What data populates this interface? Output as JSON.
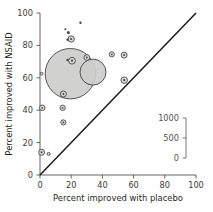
{
  "chart": {
    "type": "scatter",
    "title": "",
    "xlabel": "Percent improved with placebo",
    "ylabel": "Percent improved with NSAID",
    "xlim": [
      0,
      100
    ],
    "ylim": [
      0,
      100
    ],
    "xticks": [
      "0",
      "20",
      "40",
      "60",
      "80",
      "100"
    ],
    "yticks": [
      "0",
      "20",
      "40",
      "60",
      "80",
      "100"
    ],
    "grid": false,
    "reference_line": {
      "name": "line-of-equality",
      "from": [
        0,
        0
      ],
      "to": [
        100,
        100
      ]
    },
    "size_legend": {
      "name": "bubble-size-scale",
      "title": "",
      "ticks": [
        "1000",
        "500",
        "0"
      ],
      "values": [
        1000,
        500,
        0
      ]
    },
    "marker_semantics": {
      "area_encodes": "number of patients",
      "fill_color": "#cdcdcb",
      "edge_color": "#3c3a38"
    },
    "points": [
      {
        "x": 1.0,
        "y": 14.0,
        "size": 60
      },
      {
        "x": 5.5,
        "y": 13.0,
        "size": 14
      },
      {
        "x": 1.5,
        "y": 41.5,
        "size": 50
      },
      {
        "x": 14.5,
        "y": 41.5,
        "size": 48
      },
      {
        "x": 15.0,
        "y": 32.5,
        "size": 42
      },
      {
        "x": 1.0,
        "y": 62.5,
        "size": 12
      },
      {
        "x": 19.5,
        "y": 62.5,
        "size": 980
      },
      {
        "x": 34.0,
        "y": 63.5,
        "size": 310
      },
      {
        "x": 20.5,
        "y": 70.5,
        "size": 78
      },
      {
        "x": 19.0,
        "y": 71.0,
        "size": 18
      },
      {
        "x": 30.0,
        "y": 72.5,
        "size": 38
      },
      {
        "x": 15.0,
        "y": 50.0,
        "size": 52
      },
      {
        "x": 20.0,
        "y": 84.0,
        "size": 66
      },
      {
        "x": 19.0,
        "y": 83.5,
        "size": 16
      },
      {
        "x": 19.5,
        "y": 88.0,
        "size": 30
      },
      {
        "x": 17.5,
        "y": 90.0,
        "size": 14
      },
      {
        "x": 27.0,
        "y": 94.0,
        "size": 20
      },
      {
        "x": 46.0,
        "y": 74.5,
        "size": 44
      },
      {
        "x": 54.0,
        "y": 74.0,
        "size": 56
      },
      {
        "x": 54.0,
        "y": 58.5,
        "size": 70
      }
    ]
  }
}
